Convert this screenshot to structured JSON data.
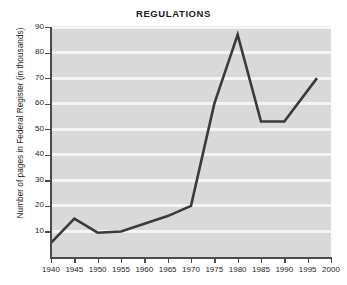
{
  "chart_data": {
    "type": "line",
    "title": "REGULATIONS",
    "xlabel": "",
    "ylabel": "Number of pages in Federal Register (in thousands)",
    "x": [
      1940,
      1945,
      1950,
      1955,
      1960,
      1965,
      1970,
      1975,
      1980,
      1985,
      1990,
      1997
    ],
    "values": [
      5.5,
      15,
      9.5,
      10,
      13,
      16,
      20,
      60,
      87,
      53,
      53,
      70
    ],
    "series": [
      {
        "name": "Pages in Federal Register",
        "values": [
          5.5,
          15,
          9.5,
          10,
          13,
          16,
          20,
          60,
          87,
          53,
          53,
          70
        ]
      }
    ],
    "xlim": [
      1940,
      2000
    ],
    "ylim": [
      0,
      90
    ],
    "xticks": [
      1940,
      1945,
      1950,
      1955,
      1960,
      1965,
      1970,
      1975,
      1980,
      1985,
      1990,
      1995,
      2000
    ],
    "xtick_labels": [
      "1940",
      "1945",
      "1950",
      "1955",
      "1960",
      "1965",
      "1970",
      "1975",
      "1980",
      "1985",
      "1990",
      "1995",
      "2000"
    ],
    "yticks": [
      10,
      20,
      30,
      40,
      50,
      60,
      70,
      80,
      90
    ],
    "ytick_labels": [
      "10",
      "20",
      "30",
      "40",
      "50",
      "60",
      "70",
      "80",
      "90"
    ],
    "grid": "horizontal",
    "legend": "none",
    "annotations": [],
    "colors": {
      "line": "#3a3a3a",
      "plot_background": "#d9d9d9",
      "gridline": "#f4f4f4",
      "axis": "#4a4a4a",
      "text": "#1b1b1b",
      "figure_background": "#ffffff"
    },
    "line_width": 2.6
  }
}
